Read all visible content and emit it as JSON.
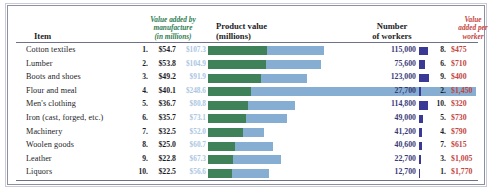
{
  "headers": {
    "item": "Item",
    "value_added": "Value added by manufacture (in millions)",
    "value_added_line1": "Value added by",
    "value_added_line2": "manufacture",
    "value_added_line3": "(in millions)",
    "product_value_line1": "Product value",
    "product_value_line2": "(millions)",
    "workers_line1": "Number",
    "workers_line2": "of workers",
    "per_worker_line1": "Value",
    "per_worker_line2": "added per",
    "per_worker_line3": "worker"
  },
  "colors": {
    "value_added_bar": "#3f8159",
    "product_value_bar": "#86aed2",
    "workers_bar": "#3a3a96",
    "value_added_header": "#2f7d52",
    "product_value_text": "#a9c6e2",
    "per_worker_text": "#c4453f",
    "workers_text": "#3a3a78",
    "frame_border": "#8d8fa3"
  },
  "chart_data": {
    "type": "bar",
    "title": "",
    "xlabel": "",
    "ylabel": "",
    "legend_position": "none",
    "grid": false,
    "categories": [
      "Cotton textiles",
      "Lumber",
      "Boots and shoes",
      "Flour and meal",
      "Men's clothing",
      "Iron (cast, forged, etc.)",
      "Machinery",
      "Woolen goods",
      "Leather",
      "Liquors"
    ],
    "series": [
      {
        "name": "Value added by manufacture (in millions)",
        "values": [
          54.7,
          53.8,
          49.2,
          40.1,
          36.7,
          35.7,
          32.5,
          25.0,
          22.8,
          22.5
        ]
      },
      {
        "name": "Product value (millions)",
        "values": [
          107.3,
          104.9,
          91.9,
          248.6,
          80.8,
          73.1,
          52.0,
          60.7,
          67.3,
          56.6
        ]
      },
      {
        "name": "Number of workers",
        "values": [
          115000,
          75600,
          123000,
          27700,
          114800,
          49000,
          41200,
          40600,
          22700,
          12700
        ]
      },
      {
        "name": "Value added per worker",
        "values": [
          475,
          710,
          400,
          1450,
          320,
          730,
          790,
          615,
          1005,
          1770
        ]
      }
    ]
  },
  "rows": [
    {
      "item": "Cotton textiles",
      "rank": "1.",
      "value_added": "$54.7",
      "product_value": "$107.3",
      "workers": "115,000",
      "per_worker_rank": "8.",
      "per_worker": "$475",
      "va_num": 54.7,
      "pv_num": 107.3,
      "w_num": 115000
    },
    {
      "item": "Lumber",
      "rank": "2.",
      "value_added": "$53.8",
      "product_value": "$104.9",
      "workers": "75,600",
      "per_worker_rank": "6.",
      "per_worker": "$710",
      "va_num": 53.8,
      "pv_num": 104.9,
      "w_num": 75600
    },
    {
      "item": "Boots and shoes",
      "rank": "3.",
      "value_added": "$49.2",
      "product_value": "$91.9",
      "workers": "123,000",
      "per_worker_rank": "9.",
      "per_worker": "$400",
      "va_num": 49.2,
      "pv_num": 91.9,
      "w_num": 123000
    },
    {
      "item": "Flour and meal",
      "rank": "4.",
      "value_added": "$40.1",
      "product_value": "$248.6",
      "workers": "27,700",
      "per_worker_rank": "2.",
      "per_worker": "$1,450",
      "va_num": 40.1,
      "pv_num": 248.6,
      "w_num": 27700
    },
    {
      "item": "Men's clothing",
      "rank": "5.",
      "value_added": "$36.7",
      "product_value": "$80.8",
      "workers": "114,800",
      "per_worker_rank": "10.",
      "per_worker": "$320",
      "va_num": 36.7,
      "pv_num": 80.8,
      "w_num": 114800
    },
    {
      "item": "Iron (cast, forged, etc.)",
      "rank": "6.",
      "value_added": "$35.7",
      "product_value": "$73.1",
      "workers": "49,000",
      "per_worker_rank": "5.",
      "per_worker": "$730",
      "va_num": 35.7,
      "pv_num": 73.1,
      "w_num": 49000
    },
    {
      "item": "Machinery",
      "rank": "7.",
      "value_added": "$32.5",
      "product_value": "$52.0",
      "workers": "41,200",
      "per_worker_rank": "4.",
      "per_worker": "$790",
      "va_num": 32.5,
      "pv_num": 52.0,
      "w_num": 41200
    },
    {
      "item": "Woolen goods",
      "rank": "8.",
      "value_added": "$25.0",
      "product_value": "$60.7",
      "workers": "40,600",
      "per_worker_rank": "7.",
      "per_worker": "$615",
      "va_num": 25.0,
      "pv_num": 60.7,
      "w_num": 40600
    },
    {
      "item": "Leather",
      "rank": "9.",
      "value_added": "$22.8",
      "product_value": "$67.3",
      "workers": "22,700",
      "per_worker_rank": "3.",
      "per_worker": "$1,005",
      "va_num": 22.8,
      "pv_num": 67.3,
      "w_num": 22700
    },
    {
      "item": "Liquors",
      "rank": "10.",
      "value_added": "$22.5",
      "product_value": "$56.6",
      "workers": "12,700",
      "per_worker_rank": "1.",
      "per_worker": "$1,770",
      "va_num": 22.5,
      "pv_num": 56.6,
      "w_num": 12700
    }
  ]
}
